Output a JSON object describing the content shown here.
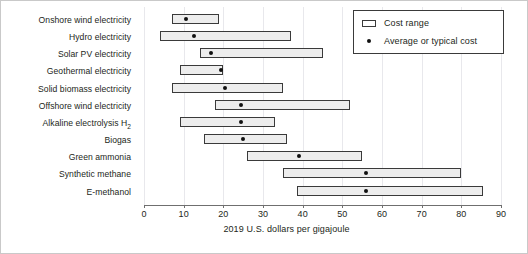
{
  "chart_data": {
    "type": "bar",
    "subtype": "floating-range-bar-with-point-markers",
    "title": "",
    "xlabel": "2019 U.S. dollars per gigajoule",
    "ylabel": "",
    "xlim": [
      0,
      90
    ],
    "xticks": [
      0,
      10,
      20,
      30,
      40,
      50,
      60,
      70,
      80,
      90
    ],
    "xticklabels": [
      "0",
      "10",
      "20",
      "30",
      "40",
      "50",
      "60",
      "70",
      "80",
      "90"
    ],
    "grid": "vertical",
    "legend_position": "top-right",
    "legend": [
      {
        "key": "cost-range",
        "label": "Cost range",
        "marker": "rectangle"
      },
      {
        "key": "average-cost",
        "label": "Average or typical cost",
        "marker": "dot"
      }
    ],
    "categories": [
      "Onshore wind electricity",
      "Hydro electricity",
      "Solar PV electricity",
      "Geothermal electricity",
      "Solid biomass electricity",
      "Offshore wind electricity",
      "Alkaline electrolysis H₂",
      "Biogas",
      "Green ammonia",
      "Synthetic methane",
      "E-methanol"
    ],
    "series": [
      {
        "name": "Cost range",
        "type": "range",
        "low": [
          7,
          4,
          14,
          9,
          7,
          18,
          9,
          15,
          26,
          35,
          38.5
        ],
        "high": [
          19,
          37,
          45,
          20,
          35,
          52,
          33,
          36,
          55,
          80,
          85.5
        ]
      },
      {
        "name": "Average or typical cost",
        "type": "point",
        "values": [
          10.5,
          12.5,
          17,
          19.5,
          20.5,
          24.5,
          24.5,
          25,
          39,
          56,
          56
        ]
      }
    ],
    "rows": [
      {
        "label": "Onshore wind electricity",
        "low": 7,
        "high": 19,
        "avg": 10.5,
        "sublabel": "",
        "subscript": ""
      },
      {
        "label": "Hydro electricity",
        "low": 4,
        "high": 37,
        "avg": 12.5,
        "sublabel": "",
        "subscript": ""
      },
      {
        "label": "Solar PV electricity",
        "low": 14,
        "high": 45,
        "avg": 17,
        "sublabel": "",
        "subscript": ""
      },
      {
        "label": "Geothermal electricity",
        "low": 9,
        "high": 20,
        "avg": 19.5,
        "sublabel": "",
        "subscript": ""
      },
      {
        "label": "Solid biomass electricity",
        "low": 7,
        "high": 35,
        "avg": 20.5,
        "sublabel": "",
        "subscript": ""
      },
      {
        "label": "Offshore wind electricity",
        "low": 18,
        "high": 52,
        "avg": 24.5,
        "sublabel": "",
        "subscript": ""
      },
      {
        "label": "Alkaline electrolysis H",
        "low": 9,
        "high": 33,
        "avg": 24.5,
        "sublabel": "Alkaline electrolysis H₂",
        "subscript": "2"
      },
      {
        "label": "Biogas",
        "low": 15,
        "high": 36,
        "avg": 25,
        "sublabel": "",
        "subscript": ""
      },
      {
        "label": "Green ammonia",
        "low": 26,
        "high": 55,
        "avg": 39,
        "sublabel": "",
        "subscript": ""
      },
      {
        "label": "Synthetic methane",
        "low": 35,
        "high": 80,
        "avg": 56,
        "sublabel": "",
        "subscript": ""
      },
      {
        "label": "E-methanol",
        "low": 38.5,
        "high": 85.5,
        "avg": 56,
        "sublabel": "",
        "subscript": ""
      }
    ],
    "colors": {
      "bar_fill": "#ededed",
      "bar_stroke": "#3a3a3a",
      "dot": "#111111",
      "grid": "#e8e8ec",
      "axis": "#6f6f6f",
      "text": "#231f20",
      "background": "#ffffff"
    }
  }
}
